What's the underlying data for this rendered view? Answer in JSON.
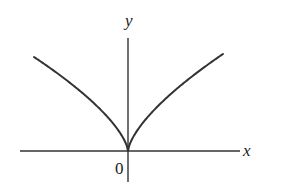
{
  "chart_data": {
    "type": "line",
    "title": "",
    "xlabel": "x",
    "ylabel": "y",
    "origin_label": "0",
    "function": "y = |x|^(2/3)",
    "grid": false,
    "legend": null,
    "series": [
      {
        "name": "curve",
        "color": "#333333",
        "x": [
          -94,
          -80,
          -60,
          -40,
          -20,
          -10,
          -4,
          0,
          4,
          10,
          20,
          40,
          60,
          80,
          95
        ],
        "y": [
          94,
          84.7,
          69.6,
          53.6,
          33.8,
          21.3,
          11.6,
          0,
          11.6,
          21.3,
          33.8,
          53.6,
          69.6,
          84.7,
          97
        ]
      }
    ],
    "ylim": [
      -31,
      113
    ],
    "xlim": [
      -108,
      112
    ]
  },
  "labels": {
    "x_axis": "x",
    "y_axis": "y",
    "origin": "0"
  },
  "colors": {
    "stroke": "#333333",
    "axis": "#333333",
    "background": "#ffffff"
  }
}
